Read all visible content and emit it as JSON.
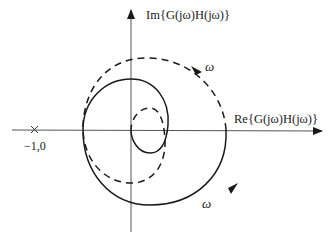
{
  "diagram": {
    "type": "nyquist_plot",
    "axes": {
      "imag_label": "Im{G(jω)H(jω)}",
      "real_label": "Re{G(jω)H(jω)}"
    },
    "critical_point": {
      "marker": "×",
      "label": "−1,0"
    },
    "curves": [
      {
        "name": "positive-frequency",
        "style": "solid",
        "direction_label": "ω"
      },
      {
        "name": "negative-frequency",
        "style": "dashed",
        "direction_label": "ω"
      }
    ],
    "colors": {
      "stroke": "#1a1a1a",
      "axis": "#555555",
      "background": "#ffffff"
    }
  }
}
